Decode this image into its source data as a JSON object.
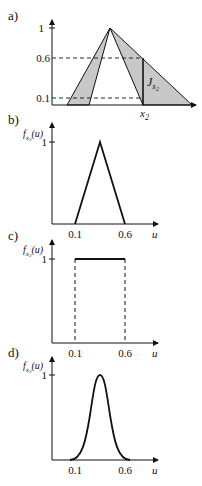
{
  "panels": {
    "a": {
      "label": "a)",
      "y_ticks": [
        "1",
        "0.6",
        "0.1"
      ],
      "x_marker": "x",
      "x_marker_sub": "2",
      "interval_label": "J",
      "interval_label_sub": "x2",
      "fill_color": "#c8c8c8",
      "line_color": "#111111"
    },
    "b": {
      "label": "b)",
      "ylabel": "f",
      "ylabel_sub": "x2",
      "ylabel_arg": "(u)",
      "y_tick": "1",
      "x_ticks": [
        "0.1",
        "0.6"
      ],
      "xlabel": "u",
      "shape": "triangle"
    },
    "c": {
      "label": "c)",
      "ylabel": "f",
      "ylabel_sub": "x2",
      "ylabel_arg": "(u)",
      "y_tick": "1",
      "x_ticks": [
        "0.1",
        "0.6"
      ],
      "xlabel": "u",
      "shape": "rectangle"
    },
    "d": {
      "label": "d)",
      "ylabel": "f",
      "ylabel_sub": "x2",
      "ylabel_arg": "(u)",
      "y_tick": "1",
      "x_ticks": [
        "0.1",
        "0.6"
      ],
      "xlabel": "u",
      "shape": "gaussian"
    }
  }
}
